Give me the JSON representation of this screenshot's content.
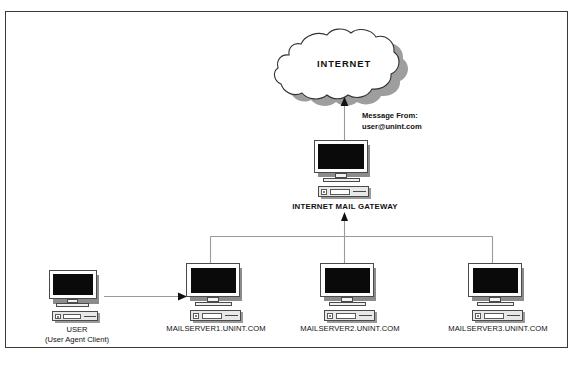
{
  "diagram": {
    "title_text": "INTERNET",
    "frame": {
      "border_color": "#3a3a3a"
    },
    "colors": {
      "screen": "#0a0a0a",
      "shadow": "#8c8c8c",
      "line": "#9a9a9a",
      "arrow": "#111111",
      "text": "#111111",
      "cloud_fill": "#ffffff",
      "cloud_stroke": "#333333",
      "cloud_shadow": "#9e9e9e"
    },
    "cloud": {
      "label": "INTERNET"
    },
    "annotation": {
      "line1": "Message From:",
      "line2": "user@unint.com"
    },
    "gateway": {
      "label": "INTERNET MAIL GATEWAY"
    },
    "user": {
      "label": "USER",
      "sublabel": "(User Agent Client)"
    },
    "servers": [
      {
        "label": "MAILSERVER1.UNINT.COM"
      },
      {
        "label": "MAILSERVER2.UNINT.COM"
      },
      {
        "label": "MAILSERVER3.UNINT.COM"
      }
    ],
    "connections": [
      {
        "name": "user-to-mailserver1",
        "type": "arrow-right"
      },
      {
        "name": "mailserver-bus",
        "type": "bus-line"
      },
      {
        "name": "bus-to-gateway",
        "type": "arrow-up"
      },
      {
        "name": "gateway-to-internet",
        "type": "arrow-up"
      }
    ]
  }
}
